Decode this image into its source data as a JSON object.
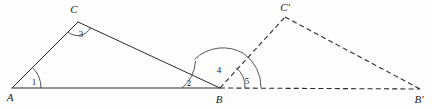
{
  "figure": {
    "kind": "geometry-diagram",
    "background_color": "#fdfdfc",
    "ink_color": "#2b2b2b",
    "width": 432,
    "height": 109
  },
  "points": {
    "A": {
      "label": "A",
      "x": 12,
      "y": 88,
      "label_x": 10,
      "label_y": 101
    },
    "B": {
      "label": "B",
      "x": 220,
      "y": 88,
      "label_x": 217,
      "label_y": 103
    },
    "C": {
      "label": "C",
      "x": 78,
      "y": 22,
      "label_x": 72,
      "label_y": 13
    },
    "Cp": {
      "label": "C'",
      "x": 285,
      "y": 17,
      "label_x": 279,
      "label_y": 11
    },
    "Bp": {
      "label": "B'",
      "x": 420,
      "y": 89,
      "label_x": 414,
      "label_y": 103
    }
  },
  "segments": [
    {
      "name": "segment-AB",
      "from": "A",
      "to": "B",
      "style": "solid"
    },
    {
      "name": "segment-AC",
      "from": "A",
      "to": "C",
      "style": "solid"
    },
    {
      "name": "segment-CB",
      "from": "C",
      "to": "B",
      "style": "solid"
    },
    {
      "name": "segment-B-Bprime",
      "from": "B",
      "to": "Bp",
      "style": "dashed"
    },
    {
      "name": "segment-B-Cprime",
      "from": "B",
      "to": "Cp",
      "style": "dashed"
    },
    {
      "name": "segment-Cprime-Bprime",
      "from": "Cp",
      "to": "Bp",
      "style": "dashed"
    }
  ],
  "angles": [
    {
      "id": "1",
      "label": "1",
      "vertex": "A",
      "label_x": 34,
      "label_y": 84,
      "note": "angle CAB at vertex A"
    },
    {
      "id": "2",
      "label": "2",
      "vertex": "B",
      "label_x": 188,
      "label_y": 85,
      "note": "angle ABC at vertex B"
    },
    {
      "id": "3",
      "label": "3",
      "vertex": "C",
      "label_x": 81,
      "label_y": 36,
      "note": "angle ACB at vertex C"
    },
    {
      "id": "4",
      "label": "4",
      "vertex": "B",
      "label_x": 219,
      "label_y": 72,
      "note": "angle CBC' at vertex B"
    },
    {
      "id": "5",
      "label": "5",
      "vertex": "B",
      "label_x": 247,
      "label_y": 83,
      "note": "angle C'BB' at vertex B"
    }
  ],
  "colors": {
    "ink": "#2b2b2b",
    "arc": "#3a3a3a",
    "paper": "#fdfdfc"
  }
}
